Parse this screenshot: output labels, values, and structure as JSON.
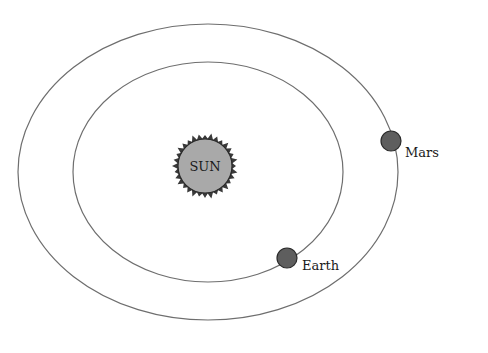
{
  "diagram": {
    "colors": {
      "background": "#ffffff",
      "orbit": "#6e6e6e",
      "sun_fill": "#a9a9a9",
      "sun_rays": "#3a3a3a",
      "planet_fill": "#5e5e5e",
      "planet_stroke": "#2a2a2a",
      "text": "#1a1a1a"
    },
    "sun": {
      "label": "SUN",
      "cx": 205,
      "cy": 166,
      "r": 27
    },
    "orbits": [
      {
        "name": "earth-orbit",
        "cx": 208,
        "cy": 172,
        "rx": 135,
        "ry": 110
      },
      {
        "name": "mars-orbit",
        "cx": 208,
        "cy": 172,
        "rx": 190,
        "ry": 148
      }
    ],
    "planets": [
      {
        "label": "Earth",
        "cx": 287,
        "cy": 258,
        "r": 10,
        "label_x": 302,
        "label_y": 270
      },
      {
        "label": "Mars",
        "cx": 391,
        "cy": 141,
        "r": 10,
        "label_x": 405,
        "label_y": 157
      }
    ]
  }
}
